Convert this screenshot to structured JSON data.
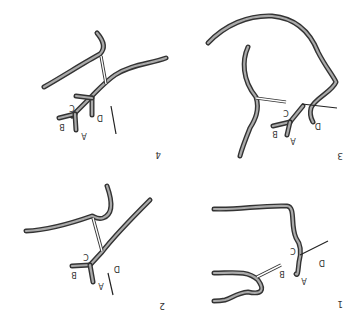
{
  "figure": {
    "orientation": "rotated-180",
    "panels": [
      {
        "number": "1",
        "labels": {
          "A": "A",
          "B": "B",
          "C": "C",
          "D": "D"
        }
      },
      {
        "number": "2",
        "labels": {
          "A": "A",
          "B": "B",
          "C": "C",
          "D": "D"
        }
      },
      {
        "number": "3",
        "labels": {
          "A": "A",
          "B": "B",
          "C": "C",
          "D": "D"
        }
      },
      {
        "number": "4",
        "labels": {
          "A": "A",
          "B": "B",
          "C": "C",
          "D": "D"
        }
      }
    ],
    "colors": {
      "vessel_outline": "#333333",
      "vessel_fill": "#aaaaaa",
      "background": "#ffffff"
    }
  }
}
